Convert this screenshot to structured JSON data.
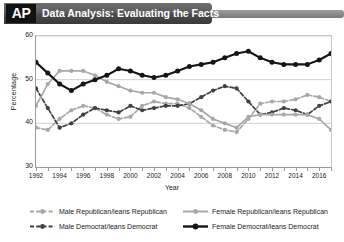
{
  "header": {
    "logo": "AP",
    "title": "Data Analysis: Evaluating the Facts"
  },
  "chart_data": {
    "type": "line",
    "title": "",
    "xlabel": "Year",
    "ylabel": "Percentage",
    "xlim": [
      1992,
      2017
    ],
    "ylim": [
      30,
      60
    ],
    "yticks": [
      30,
      40,
      50,
      60
    ],
    "xticks": [
      1992,
      1994,
      1996,
      1998,
      2000,
      2002,
      2004,
      2006,
      2008,
      2010,
      2012,
      2014,
      2016
    ],
    "xticks_minor": [
      1993,
      1995,
      1997,
      1999,
      2001,
      2003,
      2005,
      2007,
      2009,
      2011,
      2013,
      2015,
      2017
    ],
    "grid": "horizontal",
    "legend_position": "bottom",
    "x": [
      1992,
      1993,
      1994,
      1995,
      1996,
      1997,
      1998,
      1999,
      2000,
      2001,
      2002,
      2003,
      2004,
      2005,
      2006,
      2007,
      2008,
      2009,
      2010,
      2011,
      2012,
      2013,
      2014,
      2015,
      2016,
      2017
    ],
    "series": [
      {
        "name": "Male Republican/leans Republican",
        "color": "#a8a8a8",
        "linestyle": "dashed",
        "marker": "circle",
        "values": [
          39,
          38.5,
          41,
          43,
          44,
          43.5,
          42,
          41,
          41.5,
          44,
          45,
          44.5,
          44.5,
          43.5,
          41.5,
          39.5,
          38.5,
          38,
          41,
          44.5,
          45,
          45,
          45.5,
          46.5,
          46,
          45
        ]
      },
      {
        "name": "Male Democrat/leans Democrat",
        "color": "#404040",
        "linestyle": "dashed",
        "marker": "circle",
        "values": [
          48,
          43.5,
          39,
          40,
          42,
          43.5,
          43,
          42.5,
          44,
          43,
          43.5,
          44,
          44,
          44.5,
          46,
          47.5,
          48.5,
          48,
          45,
          42,
          42.5,
          43.5,
          43,
          42,
          44,
          45
        ]
      },
      {
        "name": "Female Republican/leans Republican",
        "color": "#a8a8a8",
        "linestyle": "solid",
        "marker": "circle",
        "values": [
          44,
          49,
          52,
          52,
          52,
          51,
          49.5,
          48.5,
          47.5,
          47,
          47,
          46,
          45.5,
          44.5,
          43,
          41,
          40,
          39,
          41.5,
          42,
          42,
          42,
          42,
          42,
          41,
          38.5
        ]
      },
      {
        "name": "Female Democrat/leans Democrat",
        "color": "#151515",
        "linestyle": "solid",
        "marker": "circle",
        "values": [
          54,
          51.5,
          49,
          47.5,
          49,
          50,
          51,
          52.5,
          52,
          51,
          50.5,
          51,
          52,
          53,
          53.5,
          54,
          55,
          56,
          56.5,
          55,
          54,
          53.5,
          53.5,
          53.5,
          54.5,
          56
        ]
      }
    ]
  }
}
